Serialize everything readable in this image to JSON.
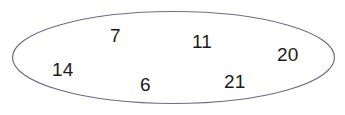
{
  "figure": {
    "type": "set-diagram",
    "shape": "ellipse",
    "background_color": "#ffffff",
    "outline_color": "#6b6b8a",
    "outline_width_px": 1.2,
    "text_color": "#1b1b1b"
  },
  "set": {
    "name": "number-set",
    "member_count": 6,
    "members": [
      {
        "label": "7",
        "x": 110,
        "y": 26
      },
      {
        "label": "11",
        "x": 192,
        "y": 32
      },
      {
        "label": "20",
        "x": 277,
        "y": 45
      },
      {
        "label": "14",
        "x": 52,
        "y": 60
      },
      {
        "label": "6",
        "x": 140,
        "y": 75
      },
      {
        "label": "21",
        "x": 224,
        "y": 72
      }
    ]
  }
}
